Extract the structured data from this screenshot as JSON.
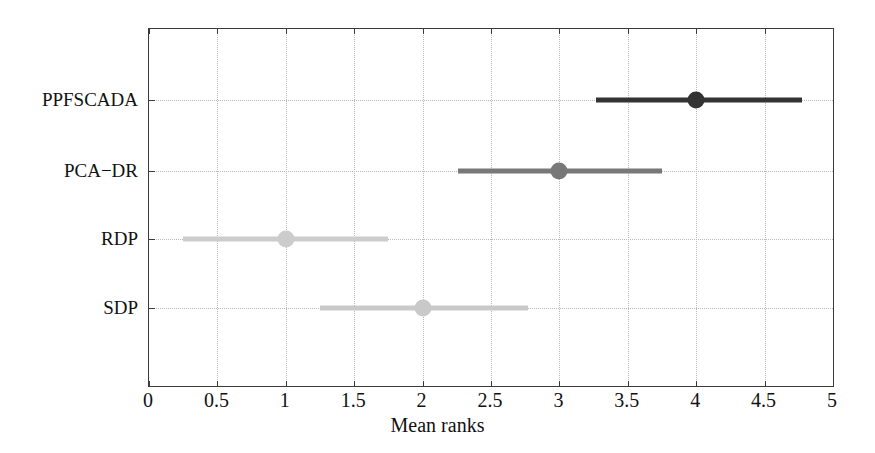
{
  "chart_data": {
    "type": "scatter",
    "title": "",
    "xlabel": "Mean ranks",
    "ylabel": "",
    "xlim": [
      0,
      5
    ],
    "xticks": [
      "0",
      "0.5",
      "1",
      "1.5",
      "2",
      "2.5",
      "3",
      "3.5",
      "4",
      "4.5",
      "5"
    ],
    "xtick_values": [
      0,
      0.5,
      1,
      1.5,
      2,
      2.5,
      3,
      3.5,
      4,
      4.5,
      5
    ],
    "grid": true,
    "grid_style": "dotted",
    "legend": "none",
    "categories": [
      "PPFSCADA",
      "PCA−DR",
      "RDP",
      "SDP"
    ],
    "values": [
      4.0,
      3.0,
      1.0,
      2.0
    ],
    "ci_low": [
      3.27,
      2.26,
      0.25,
      1.25
    ],
    "ci_high": [
      4.77,
      3.75,
      1.75,
      2.77
    ],
    "series": [
      {
        "name": "PPFSCADA",
        "mean_rank": 4.0,
        "ci_low": 3.27,
        "ci_high": 4.77,
        "color": "#333333"
      },
      {
        "name": "PCA−DR",
        "mean_rank": 3.0,
        "ci_low": 2.26,
        "ci_high": 3.75,
        "color": "#787878"
      },
      {
        "name": "RDP",
        "mean_rank": 1.0,
        "ci_low": 0.25,
        "ci_high": 1.75,
        "color": "#cccccc"
      },
      {
        "name": "SDP",
        "mean_rank": 2.0,
        "ci_low": 1.25,
        "ci_high": 2.77,
        "color": "#c9c9c9"
      }
    ]
  },
  "colors": {
    "axis": "#3a3a3a",
    "grid": "#b9b9b9",
    "text": "#111111",
    "background": "#ffffff"
  }
}
